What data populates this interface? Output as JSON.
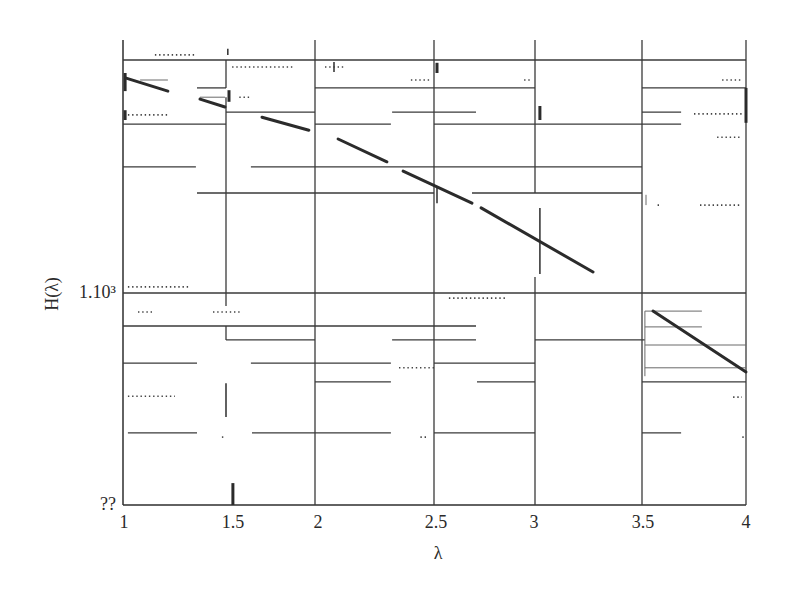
{
  "chart_data": {
    "type": "line",
    "title": "",
    "xlabel": "λ",
    "ylabel": "H(λ)",
    "xlim": [
      1,
      4
    ],
    "x_ticks": [
      1,
      1.5,
      2,
      2.5,
      3,
      3.5,
      4
    ],
    "x_tick_labels": [
      "1",
      "1.5",
      "2",
      "2.5",
      "3",
      "3.5",
      "4"
    ],
    "y_scale": "log",
    "y_ticks": [
      {
        "label": "1.10³",
        "pos": 0.456
      },
      {
        "label": "??",
        "pos": 0.0
      }
    ],
    "grid": true,
    "legend": null,
    "series": [
      {
        "name": "H(λ)",
        "segments": [
          [
            [
              1.015,
              0.918
            ],
            [
              1.218,
              0.89
            ]
          ],
          [
            [
              1.374,
              0.873
            ],
            [
              1.495,
              0.856
            ]
          ],
          [
            [
              1.702,
              0.834
            ],
            [
              1.966,
              0.806
            ]
          ],
          [
            [
              2.097,
              0.787
            ],
            [
              2.302,
              0.738
            ]
          ],
          [
            [
              2.37,
              0.718
            ],
            [
              2.688,
              0.649
            ]
          ],
          [
            [
              2.733,
              0.639
            ],
            [
              3.271,
              0.501
            ]
          ],
          [
            [
              3.553,
              0.417
            ],
            [
              4.0,
              0.286
            ]
          ]
        ]
      }
    ],
    "gridlines": {
      "horizontal": [
        {
          "y": 0.957,
          "spans": [
            [
              1.0,
              4.0
            ]
          ]
        },
        {
          "y": 0.897,
          "spans": [
            [
              1.359,
              1.5
            ],
            [
              2.0,
              3.0
            ],
            [
              3.5,
              4.0
            ]
          ]
        },
        {
          "y": 0.845,
          "spans": [
            [
              1.5,
              2.0
            ],
            [
              2.324,
              2.708
            ],
            [
              3.5,
              3.688
            ]
          ]
        },
        {
          "y": 0.819,
          "spans": [
            [
              1.0,
              1.5
            ],
            [
              2.0,
              2.319
            ],
            [
              2.5,
              3.688
            ]
          ]
        },
        {
          "y": 0.727,
          "spans": [
            [
              1.0,
              1.354
            ],
            [
              1.64,
              3.5
            ]
          ]
        },
        {
          "y": 0.671,
          "spans": [
            [
              1.359,
              2.5
            ],
            [
              2.688,
              3.5
            ]
          ]
        },
        {
          "y": 0.456,
          "spans": [
            [
              1.0,
              4.0
            ]
          ]
        },
        {
          "y": 0.385,
          "spans": [
            [
              1.0,
              2.708
            ]
          ]
        },
        {
          "y": 0.355,
          "spans": [
            [
              1.5,
              2.0
            ],
            [
              2.324,
              2.708
            ],
            [
              3.0,
              3.514
            ]
          ]
        },
        {
          "y": 0.305,
          "spans": [
            [
              1.0,
              1.359
            ],
            [
              1.64,
              2.319
            ],
            [
              2.5,
              3.0
            ]
          ]
        },
        {
          "y": 0.265,
          "spans": [
            [
              2.0,
              2.319
            ],
            [
              2.713,
              3.0
            ],
            [
              3.5,
              4.0
            ]
          ]
        },
        {
          "y": 0.155,
          "spans": [
            [
              1.024,
              1.359
            ],
            [
              1.646,
              2.319
            ],
            [
              2.5,
              3.0
            ],
            [
              3.5,
              3.688
            ]
          ]
        }
      ],
      "vertical": [
        {
          "x": 1.5,
          "spans": [
            [
              0.957,
              0.897
            ],
            [
              0.877,
              0.428
            ],
            [
              0.385,
              0.355
            ]
          ]
        },
        {
          "x": 2.0,
          "spans": [
            [
              0.0,
              1.0
            ]
          ]
        },
        {
          "x": 2.5,
          "spans": [
            [
              0.0,
              1.0
            ]
          ]
        },
        {
          "x": 3.0,
          "spans": [
            [
              0.671,
              1.0
            ],
            [
              0.0,
              0.49
            ]
          ]
        },
        {
          "x": 3.5,
          "spans": [
            [
              0.0,
              1.0
            ]
          ]
        },
        {
          "x": 4.0,
          "spans": [
            [
              0.0,
              1.0
            ]
          ]
        }
      ]
    },
    "thin_lines": [
      [
        [
          1.083,
          0.914
        ],
        [
          1.218,
          0.914
        ]
      ],
      [
        [
          1.374,
          0.877
        ],
        [
          1.495,
          0.877
        ]
      ],
      [
        [
          3.514,
          0.417
        ],
        [
          3.514,
          0.277
        ]
      ],
      [
        [
          3.514,
          0.417
        ],
        [
          3.788,
          0.417
        ]
      ],
      [
        [
          3.514,
          0.383
        ],
        [
          3.788,
          0.383
        ]
      ],
      [
        [
          3.514,
          0.344
        ],
        [
          4.0,
          0.344
        ]
      ],
      [
        [
          3.514,
          0.295
        ],
        [
          4.0,
          0.295
        ]
      ],
      [
        [
          3.519,
          0.667
        ],
        [
          3.519,
          0.645
        ]
      ]
    ],
    "marks": [
      {
        "x": 1.01,
        "y": [
          0.929,
          0.89
        ],
        "w": "thick"
      },
      {
        "x": 1.01,
        "y": [
          0.849,
          0.828
        ],
        "w": "thick"
      },
      {
        "x": 1.51,
        "y": [
          0.981,
          0.968
        ],
        "w": "thin"
      },
      {
        "x": 1.517,
        "y": [
          0.892,
          0.867
        ],
        "w": "thick"
      },
      {
        "x": 1.539,
        "y": [
          0.047,
          0.0
        ],
        "w": "thick"
      },
      {
        "x": 2.08,
        "y": [
          0.953,
          0.931
        ],
        "w": "thin"
      },
      {
        "x": 2.515,
        "y": [
          0.951,
          0.929
        ],
        "w": "thick"
      },
      {
        "x": 2.515,
        "y": [
          0.686,
          0.649
        ],
        "w": "thin"
      },
      {
        "x": 3.023,
        "y": [
          0.858,
          0.828
        ],
        "w": "thick"
      },
      {
        "x": 3.023,
        "y": [
          0.639,
          0.497
        ],
        "w": "thin"
      },
      {
        "x": 4.0,
        "y": [
          0.897,
          0.822
        ],
        "w": "thick"
      },
      {
        "x": 1.5,
        "y": [
          0.262,
          0.189
        ],
        "w": "thin"
      }
    ],
    "dotted": [
      {
        "y": 0.968,
        "spans": [
          [
            1.155,
            1.35
          ]
        ]
      },
      {
        "y": 0.942,
        "spans": [
          [
            1.534,
            1.888
          ],
          [
            2.042,
            2.126
          ]
        ]
      },
      {
        "y": 0.914,
        "spans": [
          [
            2.403,
            2.483
          ],
          [
            2.946,
            2.985
          ],
          [
            3.885,
            3.981
          ]
        ]
      },
      {
        "y": 0.877,
        "spans": [
          [
            1.575,
            1.64
          ]
        ]
      },
      {
        "y": 0.841,
        "spans": [
          [
            3.75,
            3.981
          ]
        ]
      },
      {
        "y": 0.839,
        "spans": [
          [
            1.024,
            1.218
          ]
        ]
      },
      {
        "y": 0.791,
        "spans": [
          [
            3.861,
            3.981
          ]
        ]
      },
      {
        "y": 0.645,
        "spans": [
          [
            3.575,
            3.59
          ],
          [
            3.779,
            3.981
          ]
        ]
      },
      {
        "y": 0.469,
        "spans": [
          [
            1.024,
            1.325
          ]
        ]
      },
      {
        "y": 0.445,
        "spans": [
          [
            2.574,
            2.856
          ]
        ]
      },
      {
        "y": 0.415,
        "spans": [
          [
            1.073,
            1.146
          ],
          [
            1.437,
            1.579
          ]
        ]
      },
      {
        "y": 0.295,
        "spans": [
          [
            2.353,
            2.5
          ]
        ]
      },
      {
        "y": 0.234,
        "spans": [
          [
            1.024,
            1.252
          ]
        ]
      },
      {
        "y": 0.232,
        "spans": [
          [
            3.938,
            3.981
          ]
        ]
      },
      {
        "y": 0.146,
        "spans": [
          [
            1.48,
            1.49
          ],
          [
            2.443,
            2.47
          ],
          [
            3.982,
            3.99
          ]
        ]
      }
    ]
  }
}
